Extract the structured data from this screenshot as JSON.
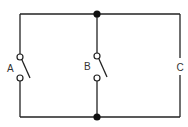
{
  "diagram": {
    "type": "circuit",
    "branches": [
      {
        "id": "A",
        "label": "A",
        "component": "switch",
        "state": "open"
      },
      {
        "id": "B",
        "label": "B",
        "component": "switch",
        "state": "open"
      },
      {
        "id": "C",
        "label": "C",
        "component": "element"
      }
    ],
    "junctions": [
      "top-junction",
      "bottom-junction"
    ],
    "colors": {
      "wire": "#222222",
      "background": "#ffffff"
    }
  }
}
